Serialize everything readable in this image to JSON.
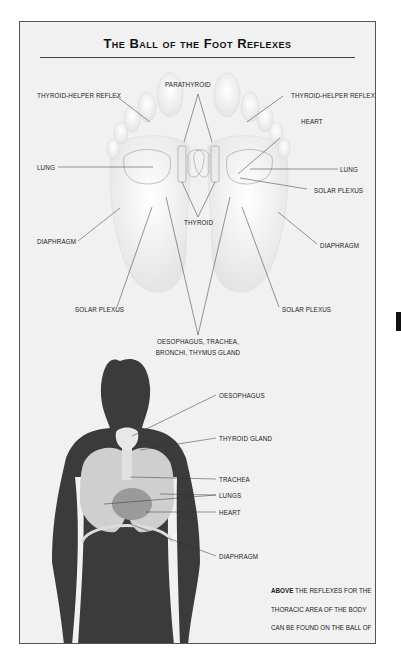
{
  "title": "The Ball of the Foot Reflexes",
  "foot_diagram": {
    "labels": {
      "parathyroid": "PARATHYROID",
      "thyroid_helper_left": "THYROID-HELPER REFLEX",
      "thyroid_helper_right": "THYROID-HELPER REFLEX",
      "heart": "HEART",
      "lung_left": "LUNG",
      "lung_right": "LUNG",
      "solar_plexus_right_upper": "SOLAR PLEXUS",
      "thyroid": "THYROID",
      "diaphragm_left": "DIAPHRAGM",
      "diaphragm_right": "DIAPHRAGM",
      "solar_plexus_left": "SOLAR PLEXUS",
      "solar_plexus_right": "SOLAR PLEXUS",
      "oesophagus_line1": "OESOPHAGUS, TRACHEA,",
      "oesophagus_line2": "BRONCHI, THYMUS GLAND"
    }
  },
  "body_diagram": {
    "labels": {
      "oesophagus": "OESOPHAGUS",
      "thyroid_gland": "THYROID GLAND",
      "trachea": "TRACHEA",
      "lungs": "LUNGS",
      "heart": "HEART",
      "diaphragm": "DIAPHRAGM"
    }
  },
  "caption": {
    "bold": "ABOVE",
    "text": " THE REFLEXES FOR THE THORACIC AREA OF THE BODY CAN BE FOUND ON THE BALL OF THE FOOT."
  },
  "colors": {
    "frame_bg": "#f1f1f1",
    "body_silhouette": "#3b3b3b",
    "lungs": "#cfcfcf",
    "heart": "#9a9a9a",
    "foot": "#fafafa"
  }
}
